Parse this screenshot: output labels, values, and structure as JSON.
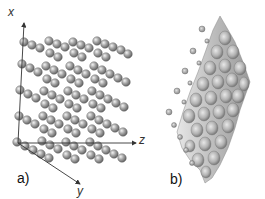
{
  "figure": {
    "panel_a": {
      "label": "a)",
      "description": "Atomic lattice of spheres in layers",
      "axes": [
        {
          "name": "x",
          "label": "x"
        },
        {
          "name": "y",
          "label": "y"
        },
        {
          "name": "z",
          "label": "z"
        }
      ],
      "layers": 5,
      "sphere_color": "#8c8c8c"
    },
    "panel_b": {
      "label": "b)",
      "description": "Corrugated potential energy surface with adsorbate dots",
      "surface_color": "#b5b5b5",
      "dot_color": "#9a9a9a"
    }
  }
}
